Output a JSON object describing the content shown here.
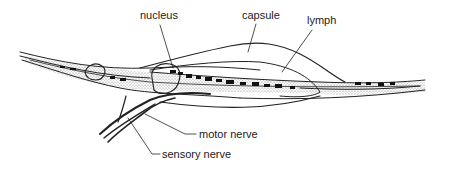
{
  "diagram": {
    "labels": {
      "nucleus": "nucleus",
      "capsule": "capsule",
      "lymph": "lymph",
      "motor_nerve": "motor nerve",
      "sensory_nerve": "sensory nerve"
    },
    "colors": {
      "ink": "#222222",
      "stipple": "#bdbdbd",
      "background": "#ffffff"
    }
  }
}
